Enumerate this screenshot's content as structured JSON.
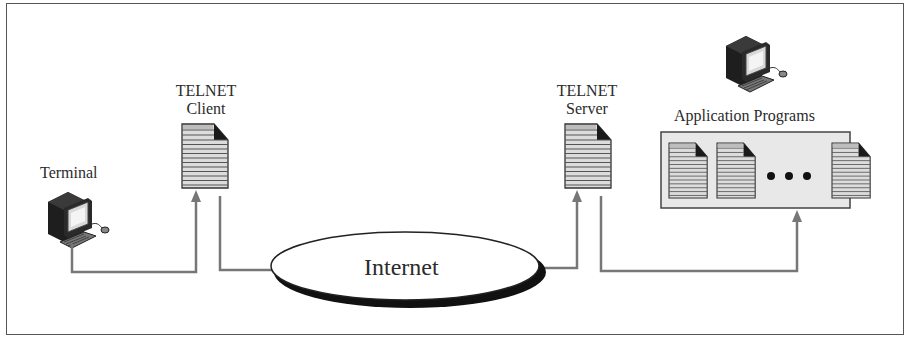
{
  "diagram": {
    "type": "network-architecture",
    "title": "",
    "nodes": {
      "terminal": {
        "label": "Terminal",
        "icon": "desktop-computer-icon"
      },
      "telnet_client": {
        "label_line1": "TELNET",
        "label_line2": "Client",
        "icon": "document-icon"
      },
      "internet": {
        "label": "Internet",
        "shape": "ellipse"
      },
      "telnet_server": {
        "label_line1": "TELNET",
        "label_line2": "Server",
        "icon": "document-icon"
      },
      "application_programs": {
        "label": "Application Programs",
        "icon": "desktop-computer-icon",
        "documents": [
          "document-icon",
          "document-icon",
          "ellipsis-dots",
          "document-icon"
        ]
      }
    },
    "connections": [
      {
        "from": "terminal",
        "to": "telnet_client",
        "arrow": "to"
      },
      {
        "from": "telnet_client",
        "to": "internet",
        "arrow": "none"
      },
      {
        "from": "internet",
        "to": "telnet_server",
        "arrow": "to"
      },
      {
        "from": "telnet_server",
        "to": "application_programs",
        "arrow": "to"
      }
    ],
    "colors": {
      "line": "#777777",
      "document_fill": "#d8d8d8",
      "document_stripe": "#555555",
      "app_box_fill": "#e6e6e6",
      "frame": "#555555"
    }
  }
}
